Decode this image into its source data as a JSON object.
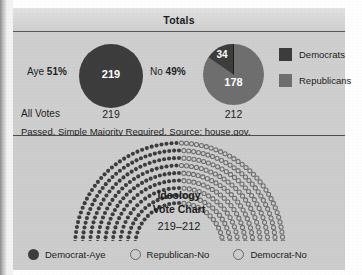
{
  "totals": {
    "title": "Totals",
    "aye": {
      "label": "Aye",
      "percent": "51%",
      "inner_value": "219",
      "under_value": "219"
    },
    "no": {
      "label": "No",
      "percent": "49%",
      "inner_value_top": "34",
      "inner_value_main": "178",
      "under_value": "212"
    },
    "all_votes_label": "All Votes",
    "source_text": "Passed. Simple Majority Required. Source: ",
    "source_link": "house.gov."
  },
  "party_legend": [
    {
      "label": "Democrats",
      "color": "#3d3d3d"
    },
    {
      "label": "Republicans",
      "color": "#6f6f6f"
    }
  ],
  "arc": {
    "title_line1": "Ideology",
    "title_line2": "Vote Chart",
    "tally": "219–212"
  },
  "vote_legend": [
    {
      "label": "Democrat-Aye",
      "style": "filled"
    },
    {
      "label": "Republican-No",
      "style": "open"
    },
    {
      "label": "Democrat-No",
      "style": "open"
    }
  ],
  "chart_data": [
    {
      "type": "pie",
      "title": "Aye 51%",
      "labels": [
        "Democrats"
      ],
      "values": [
        219
      ],
      "total": 219,
      "colors": [
        "#3d3d3d"
      ]
    },
    {
      "type": "pie",
      "title": "No 49%",
      "labels": [
        "Democrats",
        "Republicans"
      ],
      "values": [
        34,
        178
      ],
      "total": 212,
      "colors": [
        "#3d3d3d",
        "#6f6f6f"
      ]
    },
    {
      "type": "bar",
      "title": "Ideology Vote Chart",
      "subtitle": "219-212",
      "categories": [
        "Democrat-Aye",
        "Republican-No",
        "Democrat-No"
      ],
      "values": [
        219,
        178,
        34
      ],
      "xlabel": "",
      "ylabel": "",
      "legend_position": "bottom",
      "grid": false,
      "note": "Hemicycle / arc seating chart of 431 total votes arranged in 9 concentric rows"
    }
  ]
}
